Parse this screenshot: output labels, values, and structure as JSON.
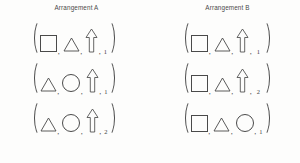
{
  "figure": {
    "columns": [
      {
        "id": "arrangement-a",
        "header": "Arrangement A",
        "rows": [
          {
            "id": "a-row-1",
            "open": "(",
            "close": ")",
            "separator": ",",
            "shapes": [
              "square",
              "triangle",
              "arrow-up"
            ],
            "value": "1"
          },
          {
            "id": "a-row-2",
            "open": "(",
            "close": ")",
            "separator": ",",
            "shapes": [
              "triangle",
              "circle",
              "arrow-up"
            ],
            "value": "1"
          },
          {
            "id": "a-row-3",
            "open": "(",
            "close": ")",
            "separator": ",",
            "shapes": [
              "triangle",
              "circle",
              "arrow-up"
            ],
            "value": "2"
          }
        ]
      },
      {
        "id": "arrangement-b",
        "header": "Arrangement B",
        "rows": [
          {
            "id": "b-row-1",
            "open": "(",
            "close": ")",
            "separator": ",",
            "shapes": [
              "square",
              "triangle",
              "arrow-up"
            ],
            "value": "1"
          },
          {
            "id": "b-row-2",
            "open": "(",
            "close": ")",
            "separator": ",",
            "shapes": [
              "square",
              "triangle",
              "arrow-up"
            ],
            "value": "2"
          },
          {
            "id": "b-row-3",
            "open": "(",
            "close": ")",
            "separator": ",",
            "shapes": [
              "square",
              "triangle",
              "circle"
            ],
            "value": "1"
          }
        ]
      }
    ],
    "colors": {
      "ink": "#4a4a4a",
      "background": "#fdfdfc"
    }
  }
}
